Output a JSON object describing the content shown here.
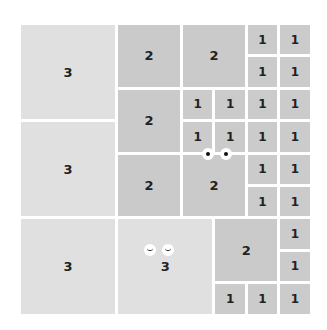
{
  "board": {
    "columns": 9,
    "rows": 9,
    "tiles": [
      {
        "value": "3",
        "col": 0,
        "row": 0,
        "w": 3,
        "h": 3
      },
      {
        "value": "3",
        "col": 0,
        "row": 3,
        "w": 3,
        "h": 3
      },
      {
        "value": "3",
        "col": 0,
        "row": 6,
        "w": 3,
        "h": 3
      },
      {
        "value": "2",
        "col": 3,
        "row": 0,
        "w": 2,
        "h": 2
      },
      {
        "value": "2",
        "col": 5,
        "row": 0,
        "w": 2,
        "h": 2
      },
      {
        "value": "1",
        "col": 7,
        "row": 0,
        "w": 1,
        "h": 1
      },
      {
        "value": "1",
        "col": 8,
        "row": 0,
        "w": 1,
        "h": 1
      },
      {
        "value": "1",
        "col": 7,
        "row": 1,
        "w": 1,
        "h": 1
      },
      {
        "value": "1",
        "col": 8,
        "row": 1,
        "w": 1,
        "h": 1
      },
      {
        "value": "2",
        "col": 3,
        "row": 2,
        "w": 2,
        "h": 2
      },
      {
        "value": "1",
        "col": 5,
        "row": 2,
        "w": 1,
        "h": 1
      },
      {
        "value": "1",
        "col": 6,
        "row": 2,
        "w": 1,
        "h": 1
      },
      {
        "value": "1",
        "col": 7,
        "row": 2,
        "w": 1,
        "h": 1
      },
      {
        "value": "1",
        "col": 8,
        "row": 2,
        "w": 1,
        "h": 1
      },
      {
        "value": "1",
        "col": 5,
        "row": 3,
        "w": 1,
        "h": 1
      },
      {
        "value": "1",
        "col": 6,
        "row": 3,
        "w": 1,
        "h": 1
      },
      {
        "value": "1",
        "col": 7,
        "row": 3,
        "w": 1,
        "h": 1
      },
      {
        "value": "1",
        "col": 8,
        "row": 3,
        "w": 1,
        "h": 1
      },
      {
        "value": "2",
        "col": 3,
        "row": 4,
        "w": 2,
        "h": 2
      },
      {
        "value": "2",
        "col": 5,
        "row": 4,
        "w": 2,
        "h": 2
      },
      {
        "value": "1",
        "col": 7,
        "row": 4,
        "w": 1,
        "h": 1
      },
      {
        "value": "1",
        "col": 8,
        "row": 4,
        "w": 1,
        "h": 1
      },
      {
        "value": "1",
        "col": 7,
        "row": 5,
        "w": 1,
        "h": 1
      },
      {
        "value": "1",
        "col": 8,
        "row": 5,
        "w": 1,
        "h": 1
      },
      {
        "value": "3",
        "col": 3,
        "row": 6,
        "w": 3,
        "h": 3
      },
      {
        "value": "2",
        "col": 6,
        "row": 6,
        "w": 2,
        "h": 2
      },
      {
        "value": "1",
        "col": 8,
        "row": 6,
        "w": 1,
        "h": 1
      },
      {
        "value": "1",
        "col": 8,
        "row": 7,
        "w": 1,
        "h": 1
      },
      {
        "value": "1",
        "col": 6,
        "row": 8,
        "w": 1,
        "h": 1
      },
      {
        "value": "1",
        "col": 7,
        "row": 8,
        "w": 1,
        "h": 1
      },
      {
        "value": "1",
        "col": 8,
        "row": 8,
        "w": 1,
        "h": 1
      }
    ]
  },
  "characters": [
    {
      "name": "open-eyes",
      "type": "open",
      "x": 202,
      "y": 148
    },
    {
      "name": "happy-eyes",
      "type": "closed",
      "x": 144,
      "y": 244
    }
  ]
}
